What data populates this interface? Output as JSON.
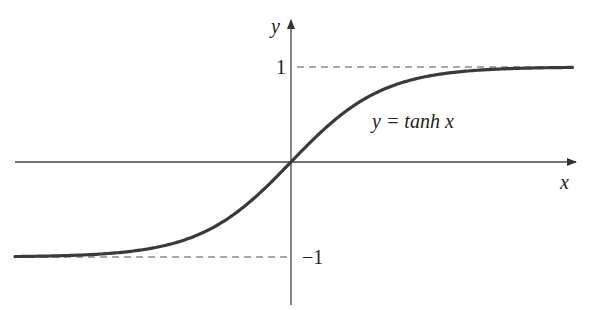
{
  "figure": {
    "function_label": "y = tanh x",
    "x_axis_label": "x",
    "y_axis_label": "y",
    "asymptote_upper_label": "1",
    "asymptote_lower_label": "−1"
  },
  "geometry": {
    "origin": [
      291,
      162
    ],
    "x_scale_px_per_unit": 92,
    "y_scale_px_per_unit": 95,
    "x_range": [
      -3.0,
      3.06
    ],
    "x_axis": {
      "x1": 15,
      "x2": 576,
      "y": 162
    },
    "y_axis": {
      "x": 291,
      "y1": 305,
      "y2": 20
    },
    "asymptote_upper": {
      "y_value": 1,
      "x1": 297,
      "x2": 572
    },
    "asymptote_lower": {
      "y_value": -1,
      "x1": 16,
      "x2": 287
    }
  },
  "colors": {
    "curve": "#3a3a3a",
    "axis": "#444444",
    "dash": "#555555",
    "text": "#222222"
  }
}
